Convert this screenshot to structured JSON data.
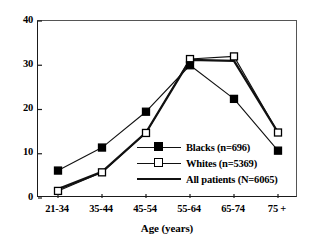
{
  "chart_data": {
    "type": "line",
    "title": "",
    "xlabel": "Age (years)",
    "ylabel": "",
    "categories": [
      "21-34",
      "35-44",
      "45-54",
      "55-64",
      "65-74",
      "75 +"
    ],
    "ylim": [
      0,
      40
    ],
    "yticks": [
      "0",
      "10",
      "20",
      "30",
      "40"
    ],
    "ytick_values": [
      0,
      10,
      20,
      30,
      40
    ],
    "grid": false,
    "legend_position": "center-right-inside",
    "series": [
      {
        "name": "Blacks (n=696)",
        "marker": "filled-square",
        "values": [
          6.2,
          11.4,
          19.5,
          30.0,
          22.4,
          10.7
        ]
      },
      {
        "name": "Whites (n=5369)",
        "marker": "open-square",
        "values": [
          1.6,
          5.8,
          14.7,
          31.4,
          32.0,
          14.8
        ]
      },
      {
        "name": "All patients (N=6065)",
        "marker": "none",
        "values": [
          2.0,
          5.9,
          14.8,
          31.2,
          31.0,
          14.8
        ]
      }
    ]
  },
  "axis": {
    "x_title": "Age (years)"
  },
  "legend": {
    "items": [
      {
        "label": "Blacks (n=696)"
      },
      {
        "label": "Whites (n=5369)"
      },
      {
        "label": "All patients (N=6065)"
      }
    ]
  },
  "colors": {
    "line": "#111111",
    "frame": "#1a1a1a",
    "background": "#ffffff"
  }
}
